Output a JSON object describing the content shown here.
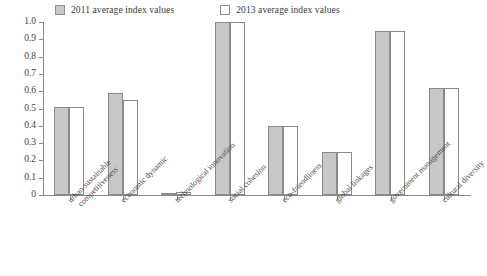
{
  "chart_data": {
    "type": "bar",
    "title": "",
    "subtitle": "",
    "xlabel": "",
    "ylabel": "",
    "ylim": [
      0,
      1.0
    ],
    "grid": false,
    "legend_position": "top-left",
    "ytick_labels": [
      "1.0",
      "0.9",
      "0.8",
      "0.7",
      "0.6",
      "0.5",
      "0.4",
      "0.3",
      "0.2",
      "0.1",
      "0"
    ],
    "ytick_values": [
      1.0,
      0.9,
      0.8,
      0.7,
      0.6,
      0.5,
      0.4,
      0.3,
      0.2,
      0.1,
      0
    ],
    "categories": [
      "urban sustainable competitiveness",
      "economic dynamic",
      "technological innovation",
      "social cohesion",
      "eco-friendliness",
      "global linkages",
      "government management",
      "cultural diversity"
    ],
    "category_lines": [
      [
        "urban sustainable",
        "competitiveness"
      ],
      [
        "economic dynamic"
      ],
      [
        "technological innovation"
      ],
      [
        "social cohesion"
      ],
      [
        "eco-friendliness"
      ],
      [
        "global linkages"
      ],
      [
        "government management"
      ],
      [
        "cultural diversity"
      ]
    ],
    "series": [
      {
        "name": "2011 average index values",
        "color": "#c8c8c8",
        "values": [
          0.51,
          0.59,
          0.01,
          1.0,
          0.4,
          0.25,
          0.95,
          0.62
        ]
      },
      {
        "name": "2013 average index values",
        "color": "#ffffff",
        "values": [
          0.51,
          0.55,
          0.02,
          1.0,
          0.4,
          0.25,
          0.95,
          0.62
        ]
      }
    ]
  },
  "legend": {
    "entries": [
      {
        "label": "2011 average index values",
        "swatch": "filled-square-swatch"
      },
      {
        "label": "2013 average index values",
        "swatch": "hollow-square-swatch"
      }
    ]
  },
  "axes": {
    "y_axis_name": "index-value-axis",
    "x_axis_name": "dimension-axis"
  }
}
